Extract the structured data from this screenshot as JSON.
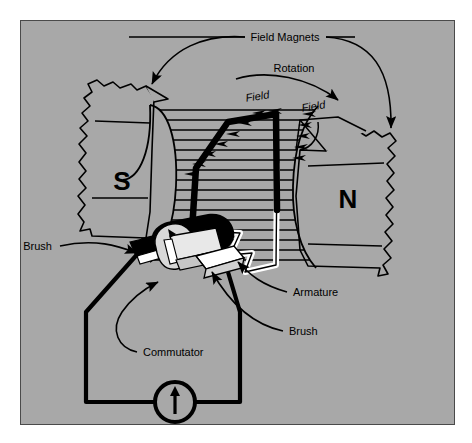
{
  "figure": {
    "kind": "dc-motor-cutaway-diagram",
    "background_color": "#ffffff",
    "panel_color": "#a8a8a8",
    "ink_color": "#000000",
    "highlight_color": "#ffffff"
  },
  "labels": {
    "field_magnets": "Field Magnets",
    "rotation": "Rotation",
    "field_left": "Field",
    "field_right": "Field",
    "pole_south": "S",
    "pole_north": "N",
    "brush_left": "Brush",
    "brush_right": "Brush",
    "armature": "Armature",
    "commutator": "Commutator"
  },
  "components": [
    {
      "name": "field-magnet-south",
      "label": "S"
    },
    {
      "name": "field-magnet-north",
      "label": "N"
    },
    {
      "name": "armature-coil",
      "label": "Armature"
    },
    {
      "name": "commutator",
      "label": "Commutator"
    },
    {
      "name": "brush-left",
      "label": "Brush"
    },
    {
      "name": "brush-right",
      "label": "Brush"
    },
    {
      "name": "current-source",
      "label": ""
    }
  ]
}
